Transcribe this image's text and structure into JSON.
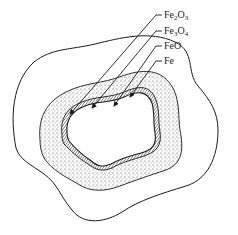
{
  "diagram": {
    "type": "iron-oxide-scale-layers",
    "labels": [
      {
        "id": "fe2o3",
        "main": "Fe",
        "sub1": "2",
        "mid": "O",
        "sub2": "3"
      },
      {
        "id": "fe3o4",
        "main": "Fe",
        "sub1": "3",
        "mid": "O",
        "sub2": "4"
      },
      {
        "id": "feo",
        "main": "FeO",
        "sub1": "",
        "mid": "",
        "sub2": ""
      },
      {
        "id": "fe",
        "main": "Fe",
        "sub1": "",
        "mid": "",
        "sub2": ""
      }
    ],
    "colors": {
      "line": "#1a1a1a",
      "background": "#ffffff",
      "stipple": "#555555"
    }
  }
}
